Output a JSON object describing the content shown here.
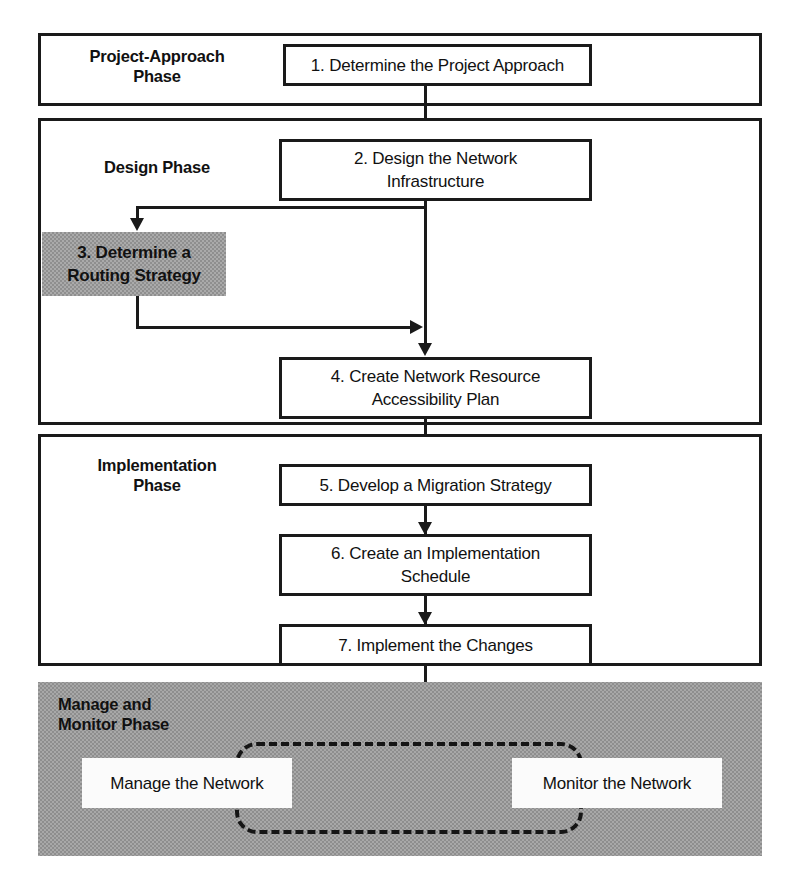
{
  "diagram": {
    "accent_gray": "#999999",
    "line_color": "#1a1a1a",
    "background": "#ffffff"
  },
  "phases": [
    {
      "id": "project-approach",
      "label": "Project-Approach\nPhase",
      "label_line1": "Project-Approach",
      "label_line2": "Phase",
      "shaded": false
    },
    {
      "id": "design",
      "label": "Design Phase",
      "label_line1": "Design Phase",
      "label_line2": "",
      "shaded": false
    },
    {
      "id": "implementation",
      "label": "Implementation\nPhase",
      "label_line1": "Implementation",
      "label_line2": "Phase",
      "shaded": false
    },
    {
      "id": "manage-monitor",
      "label": "Manage and\nMonitor Phase",
      "label_line1": "Manage and",
      "label_line2": "Monitor Phase",
      "shaded": true
    }
  ],
  "steps": [
    {
      "number": "1",
      "text": "1. Determine the Project Approach",
      "line1": "1. Determine the Project Approach",
      "line2": "",
      "highlighted": false,
      "phase": "project-approach"
    },
    {
      "number": "2",
      "text": "2. Design the Network Infrastructure",
      "line1": "2. Design the Network",
      "line2": "Infrastructure",
      "highlighted": false,
      "phase": "design"
    },
    {
      "number": "3",
      "text": "3. Determine a Routing Strategy",
      "line1": "3. Determine a",
      "line2": "Routing Strategy",
      "highlighted": true,
      "phase": "design"
    },
    {
      "number": "4",
      "text": "4. Create Network Resource Accessibility Plan",
      "line1": "4. Create Network Resource",
      "line2": "Accessibility Plan",
      "highlighted": false,
      "phase": "design"
    },
    {
      "number": "5",
      "text": "5. Develop a Migration Strategy",
      "line1": "5. Develop a Migration Strategy",
      "line2": "",
      "highlighted": false,
      "phase": "implementation"
    },
    {
      "number": "6",
      "text": "6. Create an Implementation Schedule",
      "line1": "6. Create an Implementation",
      "line2": "Schedule",
      "highlighted": false,
      "phase": "implementation"
    },
    {
      "number": "7",
      "text": "7. Implement the Changes",
      "line1": "7. Implement the Changes",
      "line2": "",
      "highlighted": false,
      "phase": "implementation"
    }
  ],
  "ongoing_tasks": [
    {
      "id": "manage-network",
      "text": "Manage the Network"
    },
    {
      "id": "monitor-network",
      "text": "Monitor the Network"
    }
  ]
}
